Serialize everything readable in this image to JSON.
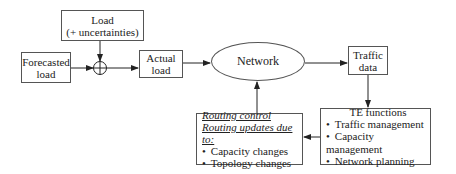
{
  "nodes": {
    "load": {
      "line1": "Load",
      "line2": "(+ uncertainties)"
    },
    "forecasted": {
      "line1": "Forecasted",
      "line2": "load"
    },
    "actual": {
      "line1": "Actual",
      "line2": "load"
    },
    "network": {
      "label": "Network"
    },
    "traffic": {
      "line1": "Traffic",
      "line2": "data"
    },
    "te": {
      "title": "TE functions",
      "items": [
        "Traffic management",
        "Capacity management",
        "Network planning"
      ]
    },
    "routing": {
      "title1": "Routing control",
      "title2": "Routing updates due to:",
      "items": [
        "Capacity changes",
        "Topology changes"
      ]
    }
  },
  "symbols": {
    "summing_junction": "⊕"
  }
}
